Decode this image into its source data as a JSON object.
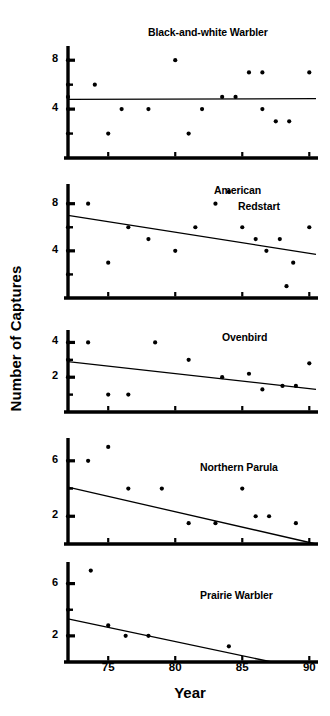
{
  "figure": {
    "ylabel": "Number of Captures",
    "xlabel": "Year",
    "xticks": [
      "75",
      "80",
      "85",
      "90"
    ]
  },
  "chart_data": [
    {
      "type": "scatter",
      "title": "Black-and-white Warbler",
      "xlabel": "Year",
      "ylabel": "Number of Captures",
      "xlim": [
        1972,
        1990.5
      ],
      "ylim": [
        0,
        9
      ],
      "xticks": [
        75,
        80,
        85,
        90
      ],
      "yticks": [
        4,
        8
      ],
      "ytick_labels": [
        "4",
        "8"
      ],
      "grid": false,
      "legend": "none",
      "points": [
        {
          "x": 1972,
          "y": 8
        },
        {
          "x": 1972,
          "y": 6
        },
        {
          "x": 1972,
          "y": 5
        },
        {
          "x": 1972,
          "y": 4
        },
        {
          "x": 1972,
          "y": 2
        },
        {
          "x": 1974,
          "y": 6
        },
        {
          "x": 1975,
          "y": 2
        },
        {
          "x": 1976,
          "y": 4
        },
        {
          "x": 1978,
          "y": 4
        },
        {
          "x": 1980,
          "y": 8
        },
        {
          "x": 1981,
          "y": 2
        },
        {
          "x": 1982,
          "y": 4
        },
        {
          "x": 1983.5,
          "y": 5
        },
        {
          "x": 1984.5,
          "y": 5
        },
        {
          "x": 1985.5,
          "y": 7
        },
        {
          "x": 1986.5,
          "y": 7
        },
        {
          "x": 1986.5,
          "y": 4
        },
        {
          "x": 1987.5,
          "y": 3
        },
        {
          "x": 1988.5,
          "y": 3
        },
        {
          "x": 1990,
          "y": 7
        }
      ],
      "trendline": {
        "x1": 1972,
        "y1": 4.8,
        "x2": 1990.5,
        "y2": 4.85
      }
    },
    {
      "type": "scatter",
      "title": "American",
      "title_line2": "Redstart",
      "xlabel": "Year",
      "ylabel": "Number of Captures",
      "xlim": [
        1972,
        1990.5
      ],
      "ylim": [
        0,
        9.5
      ],
      "xticks": [
        75,
        80,
        85,
        90
      ],
      "yticks": [
        4,
        8
      ],
      "ytick_labels": [
        "4",
        "8"
      ],
      "grid": false,
      "legend": "none",
      "points": [
        {
          "x": 1972,
          "y": 8
        },
        {
          "x": 1972,
          "y": 6
        },
        {
          "x": 1972,
          "y": 4
        },
        {
          "x": 1972,
          "y": 2
        },
        {
          "x": 1973.5,
          "y": 8
        },
        {
          "x": 1975,
          "y": 3
        },
        {
          "x": 1976.5,
          "y": 6
        },
        {
          "x": 1978,
          "y": 5
        },
        {
          "x": 1980,
          "y": 4
        },
        {
          "x": 1981.5,
          "y": 6
        },
        {
          "x": 1983,
          "y": 8
        },
        {
          "x": 1984,
          "y": 9
        },
        {
          "x": 1985,
          "y": 6
        },
        {
          "x": 1986,
          "y": 5
        },
        {
          "x": 1986.8,
          "y": 4
        },
        {
          "x": 1987.8,
          "y": 5
        },
        {
          "x": 1988.3,
          "y": 1
        },
        {
          "x": 1988.8,
          "y": 3
        },
        {
          "x": 1990,
          "y": 6
        }
      ],
      "trendline": {
        "x1": 1972,
        "y1": 7.0,
        "x2": 1990.5,
        "y2": 3.7
      }
    },
    {
      "type": "scatter",
      "title": "Ovenbird",
      "xlabel": "Year",
      "ylabel": "Number of Captures",
      "xlim": [
        1972,
        1990.5
      ],
      "ylim": [
        0,
        4.6
      ],
      "xticks": [
        75,
        80,
        85,
        90
      ],
      "yticks": [
        2,
        4
      ],
      "ytick_labels": [
        "2",
        "4"
      ],
      "grid": false,
      "legend": "none",
      "points": [
        {
          "x": 1972,
          "y": 4
        },
        {
          "x": 1972,
          "y": 3
        },
        {
          "x": 1972,
          "y": 2
        },
        {
          "x": 1973.5,
          "y": 4
        },
        {
          "x": 1975,
          "y": 1
        },
        {
          "x": 1976.5,
          "y": 1
        },
        {
          "x": 1978.5,
          "y": 4
        },
        {
          "x": 1981,
          "y": 3
        },
        {
          "x": 1983.5,
          "y": 2
        },
        {
          "x": 1985.5,
          "y": 2.2
        },
        {
          "x": 1986.5,
          "y": 1.3
        },
        {
          "x": 1988,
          "y": 1.5
        },
        {
          "x": 1989,
          "y": 1.5
        },
        {
          "x": 1990,
          "y": 2.8
        }
      ],
      "trendline": {
        "x1": 1972,
        "y1": 2.9,
        "x2": 1990.5,
        "y2": 1.3
      }
    },
    {
      "type": "scatter",
      "title": "Northern Parula",
      "xlabel": "Year",
      "ylabel": "Number of Captures",
      "xlim": [
        1972,
        1990.5
      ],
      "ylim": [
        0,
        7.5
      ],
      "xticks": [
        75,
        80,
        85,
        90
      ],
      "yticks": [
        2,
        6
      ],
      "ytick_labels": [
        "2",
        "6"
      ],
      "grid": false,
      "legend": "none",
      "points": [
        {
          "x": 1972,
          "y": 6
        },
        {
          "x": 1972,
          "y": 2
        },
        {
          "x": 1973.5,
          "y": 6
        },
        {
          "x": 1975,
          "y": 7
        },
        {
          "x": 1976.5,
          "y": 4
        },
        {
          "x": 1979,
          "y": 4
        },
        {
          "x": 1981,
          "y": 1.5
        },
        {
          "x": 1983,
          "y": 1.5
        },
        {
          "x": 1985,
          "y": 4
        },
        {
          "x": 1986,
          "y": 2
        },
        {
          "x": 1987,
          "y": 2
        },
        {
          "x": 1989,
          "y": 1.5
        }
      ],
      "trendline": {
        "x1": 1972,
        "y1": 4.1,
        "x2": 1990.5,
        "y2": 0
      }
    },
    {
      "type": "scatter",
      "title": "Prairie Warbler",
      "xlabel": "Year",
      "ylabel": "Number of Captures",
      "xlim": [
        1972,
        1990.5
      ],
      "ylim": [
        0,
        7.5
      ],
      "xticks": [
        75,
        80,
        85,
        90
      ],
      "yticks": [
        2,
        6
      ],
      "ytick_labels": [
        "2",
        "6"
      ],
      "grid": false,
      "legend": "none",
      "points": [
        {
          "x": 1972,
          "y": 6
        },
        {
          "x": 1972,
          "y": 4
        },
        {
          "x": 1972,
          "y": 2
        },
        {
          "x": 1973.7,
          "y": 7
        },
        {
          "x": 1975,
          "y": 2.8
        },
        {
          "x": 1976.3,
          "y": 2
        },
        {
          "x": 1978,
          "y": 2
        },
        {
          "x": 1984,
          "y": 1.2
        }
      ],
      "trendline": {
        "x1": 1972,
        "y1": 3.3,
        "x2": 1987.2,
        "y2": 0
      }
    }
  ]
}
